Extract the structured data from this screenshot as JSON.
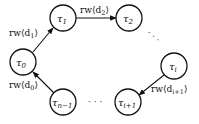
{
  "nodes": [
    {
      "id": "t0",
      "label": "τ",
      "sub": "0"
    },
    {
      "id": "t1",
      "label": "τ",
      "sub": "1"
    },
    {
      "id": "t2",
      "label": "τ",
      "sub": "2"
    },
    {
      "id": "ti",
      "label": "τ",
      "sub": "i"
    },
    {
      "id": "ti1",
      "label": "τ",
      "sub": "i+1"
    },
    {
      "id": "tn1",
      "label": "τ",
      "sub": "n−1"
    }
  ],
  "edges": [
    {
      "from": "t0",
      "to": "t1",
      "label": "rw⟨d",
      "sub": "1",
      "close": "⟩"
    },
    {
      "from": "t1",
      "to": "t2",
      "label": "rw⟨d",
      "sub": "2",
      "close": "⟩"
    },
    {
      "from": "ti",
      "to": "ti1",
      "label": "rw⟨d",
      "sub": "i+1",
      "close": "⟩"
    },
    {
      "from": "tn1",
      "to": "t0",
      "label": "rw⟨d",
      "sub": "0",
      "close": "⟩"
    }
  ],
  "ellipses": [
    "·  ·  ·",
    "· · ·"
  ]
}
